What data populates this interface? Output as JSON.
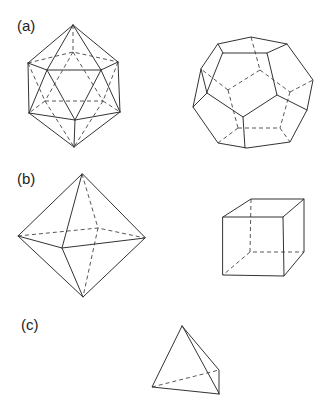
{
  "figure": {
    "panels": [
      {
        "id": "a",
        "label": "(a)",
        "solids": [
          "icosahedron",
          "dodecahedron"
        ]
      },
      {
        "id": "b",
        "label": "(b)",
        "solids": [
          "octahedron",
          "cube"
        ]
      },
      {
        "id": "c",
        "label": "(c)",
        "solids": [
          "tetrahedron"
        ]
      }
    ],
    "line_color": "#333333",
    "background": "#ffffff",
    "hidden_edges": "dashed"
  }
}
